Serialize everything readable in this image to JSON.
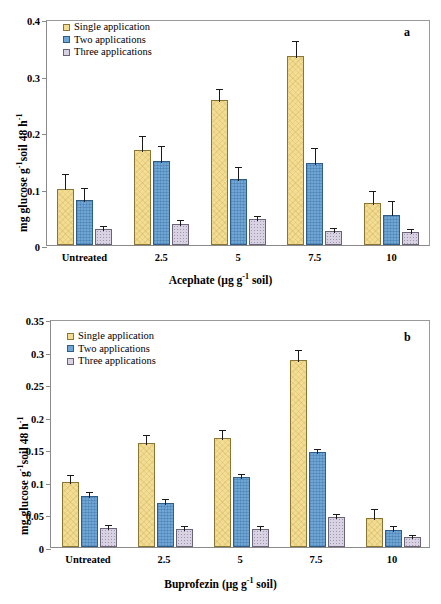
{
  "figure": {
    "panels": [
      "a",
      "b"
    ]
  },
  "panel_a": {
    "label": "a",
    "ylabel_main": "mg glucose g",
    "ylabel_sup1": "-1",
    "ylabel_mid": "soil 48 h",
    "ylabel_sup2": "-1",
    "xtitle_main": "Acephate (µg g",
    "xtitle_sup": "-1",
    "xtitle_tail": " soil)",
    "legend": [
      {
        "label": "Single application",
        "color": "#f3dc94"
      },
      {
        "label": "Two applications",
        "color": "#6ea7d6"
      },
      {
        "label": "Three applications",
        "color": "#d9d2e2"
      }
    ],
    "yticks": [
      "0",
      "0.1",
      "0.2",
      "0.3",
      "0.4"
    ],
    "xticklabels": [
      "Untreated",
      "2.5",
      "5",
      "7.5",
      "10"
    ]
  },
  "panel_b": {
    "label": "b",
    "ylabel_main": "mg glucose g",
    "ylabel_sup1": "-1",
    "ylabel_mid": "soil 48 h",
    "ylabel_sup2": "-1",
    "xtitle_main": "Buprofezin (µg g",
    "xtitle_sup": "-1",
    "xtitle_tail": " soil)",
    "legend": [
      {
        "label": "Single application",
        "color": "#f3dc94"
      },
      {
        "label": "Two applications",
        "color": "#6ea7d6"
      },
      {
        "label": "Three applications",
        "color": "#d9d2e2"
      }
    ],
    "yticks": [
      "0",
      "0.05",
      "0.1",
      "0.15",
      "0.2",
      "0.25",
      "0.3",
      "0.35"
    ],
    "xticklabels": [
      "Untreated",
      "2.5",
      "5",
      "7.5",
      "10"
    ]
  },
  "chart_data": [
    {
      "type": "bar",
      "panel": "a",
      "title": "",
      "xlabel": "Acephate (µg g-1 soil)",
      "ylabel": "mg glucose g-1 soil 48 h-1",
      "categories": [
        "Untreated",
        "2.5",
        "5",
        "7.5",
        "10"
      ],
      "ylim": [
        0,
        0.4
      ],
      "yticks": [
        0,
        0.1,
        0.2,
        0.3,
        0.4
      ],
      "grid": false,
      "legend_position": "top-left",
      "series": [
        {
          "name": "Single application",
          "color": "#f3dc94",
          "values": [
            0.1,
            0.168,
            0.257,
            0.335,
            0.075
          ],
          "errors": [
            0.03,
            0.028,
            0.023,
            0.029,
            0.025
          ]
        },
        {
          "name": "Two applications",
          "color": "#6ea7d6",
          "values": [
            0.079,
            0.148,
            0.117,
            0.145,
            0.054
          ],
          "errors": [
            0.026,
            0.03,
            0.025,
            0.031,
            0.027
          ]
        },
        {
          "name": "Three applications",
          "color": "#d9d2e2",
          "values": [
            0.029,
            0.038,
            0.046,
            0.025,
            0.023
          ],
          "errors": [
            0.009,
            0.009,
            0.008,
            0.008,
            0.008
          ]
        }
      ]
    },
    {
      "type": "bar",
      "panel": "b",
      "title": "",
      "xlabel": "Buprofezin (µg g-1 soil)",
      "ylabel": "mg glucose g-1 soil 48 h-1",
      "categories": [
        "Untreated",
        "2.5",
        "5",
        "7.5",
        "10"
      ],
      "ylim": [
        0,
        0.35
      ],
      "yticks": [
        0,
        0.05,
        0.1,
        0.15,
        0.2,
        0.25,
        0.3,
        0.35
      ],
      "grid": false,
      "legend_position": "top-left",
      "series": [
        {
          "name": "Single application",
          "color": "#f3dc94",
          "values": [
            0.1,
            0.159,
            0.167,
            0.287,
            0.045
          ],
          "errors": [
            0.013,
            0.016,
            0.016,
            0.018,
            0.017
          ]
        },
        {
          "name": "Two applications",
          "color": "#6ea7d6",
          "values": [
            0.079,
            0.068,
            0.107,
            0.146,
            0.026
          ],
          "errors": [
            0.009,
            0.008,
            0.008,
            0.007,
            0.009
          ]
        },
        {
          "name": "Three applications",
          "color": "#d9d2e2",
          "values": [
            0.029,
            0.028,
            0.027,
            0.046,
            0.015
          ],
          "errors": [
            0.008,
            0.008,
            0.008,
            0.008,
            0.007
          ]
        }
      ]
    }
  ]
}
